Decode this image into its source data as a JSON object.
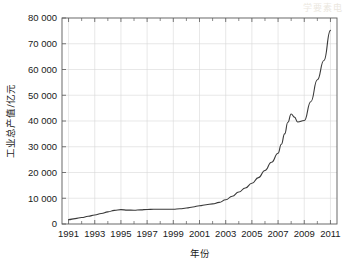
{
  "watermark": "学要素电",
  "chart_data": {
    "type": "line",
    "title": "",
    "xlabel": "年份",
    "ylabel": "工业总产值/亿元",
    "xlim": [
      1990.5,
      2011.5
    ],
    "ylim": [
      0,
      80000
    ],
    "grid": true,
    "legend": "none",
    "y_ticks": [
      0,
      10000,
      20000,
      30000,
      40000,
      50000,
      60000,
      70000,
      80000
    ],
    "y_tick_labels": [
      "0",
      "10 000",
      "20 000",
      "30 000",
      "40 000",
      "50 000",
      "60 000",
      "70 000",
      "80 000"
    ],
    "x_ticks": [
      1991,
      1993,
      1995,
      1997,
      1999,
      2001,
      2003,
      2005,
      2007,
      2009,
      2011
    ],
    "x_tick_labels": [
      "1991",
      "1993",
      "1995",
      "1997",
      "1999",
      "2001",
      "2003",
      "2005",
      "2007",
      "2009",
      "2011"
    ],
    "x_minor_ticks": [
      1992,
      1994,
      1996,
      1998,
      2000,
      2002,
      2004,
      2006,
      2008,
      2010
    ],
    "series": [
      {
        "name": "工业总产值",
        "x": [
          1991,
          1992,
          1993,
          1994,
          1995,
          1996,
          1997,
          1998,
          1999,
          2000,
          2001,
          2002,
          2003,
          2004,
          2005,
          2006,
          2007,
          2008,
          2009,
          2010,
          2011
        ],
        "values": [
          1700,
          2500,
          3500,
          4600,
          5500,
          5300,
          5600,
          5700,
          5700,
          6100,
          7000,
          7800,
          9600,
          12000,
          14500,
          18500,
          24500,
          31500,
          42500,
          39500,
          44500
        ]
      }
    ],
    "series_full": {
      "x": [
        1991,
        1991.5,
        1992,
        1992.5,
        1993,
        1993.5,
        1994,
        1994.5,
        1995,
        1995.5,
        1996,
        1996.5,
        1997,
        1997.5,
        1998,
        1998.5,
        1999,
        1999.5,
        2000,
        2000.5,
        2001,
        2001.5,
        2002,
        2002.5,
        2003,
        2003.5,
        2004,
        2004.5,
        2005,
        2005.5,
        2006,
        2006.5,
        2007,
        2007.25,
        2007.5,
        2007.75,
        2008,
        2008.25,
        2008.5,
        2009,
        2009.5,
        2010,
        2010.5,
        2011
      ],
      "y": [
        1700,
        2100,
        2500,
        3000,
        3500,
        4100,
        4700,
        5300,
        5600,
        5400,
        5350,
        5500,
        5650,
        5700,
        5700,
        5700,
        5750,
        5900,
        6200,
        6600,
        7100,
        7500,
        7800,
        8400,
        9400,
        10800,
        12400,
        14000,
        15800,
        18000,
        20800,
        24000,
        27500,
        31000,
        35000,
        39500,
        42700,
        41500,
        39600,
        40200,
        47500,
        56000,
        63500,
        75200
      ]
    },
    "annotations": []
  }
}
